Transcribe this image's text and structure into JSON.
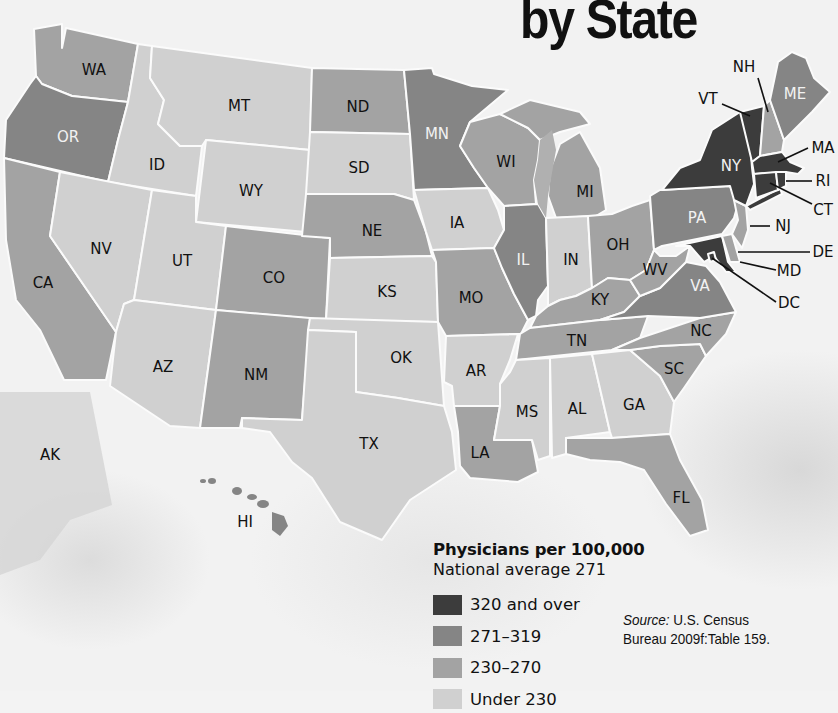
{
  "title": "by State",
  "legend": {
    "title": "Physicians per 100,000",
    "subtitle": "National average 271",
    "items": [
      {
        "label": "320 and over",
        "color": "#3c3c3c"
      },
      {
        "label": "271–319",
        "color": "#858585"
      },
      {
        "label": "230–270",
        "color": "#a3a3a3"
      },
      {
        "label": "Under 230",
        "color": "#d0d0d0"
      }
    ]
  },
  "source": {
    "prefix": "Source:",
    "line1": " U.S. Census",
    "line2": "Bureau 2009f:Table 159."
  },
  "map_data": {
    "metric": "Physicians per 100,000",
    "national_average": 271,
    "categories": [
      "320 and over",
      "271–319",
      "230–270",
      "Under 230"
    ],
    "states": {
      "NY": "320 and over",
      "VT": "320 and over",
      "MA": "320 and over",
      "CT": "320 and over",
      "RI": "320 and over",
      "MD": "320 and over",
      "DC": "320 and over",
      "OR": "271–319",
      "MN": "271–319",
      "IL": "271–319",
      "PA": "271–319",
      "VA": "271–319",
      "ME": "271–319",
      "WA": "230–270",
      "CA": "230–270",
      "CO": "230–270",
      "NM": "230–270",
      "ND": "230–270",
      "NE": "230–270",
      "MO": "230–270",
      "WI": "230–270",
      "MI": "230–270",
      "OH": "230–270",
      "KY": "230–270",
      "TN": "230–270",
      "NC": "230–270",
      "SC": "230–270",
      "LA": "230–270",
      "FL": "230–270",
      "WV": "230–270",
      "NH": "230–270",
      "NJ": "230–270",
      "DE": "230–270",
      "HI": "230–270",
      "ID": "Under 230",
      "MT": "Under 230",
      "WY": "Under 230",
      "SD": "Under 230",
      "NV": "Under 230",
      "UT": "Under 230",
      "AZ": "Under 230",
      "KS": "Under 230",
      "OK": "Under 230",
      "TX": "Under 230",
      "IA": "Under 230",
      "AR": "Under 230",
      "MS": "Under 230",
      "AL": "Under 230",
      "GA": "Under 230",
      "IN": "Under 230",
      "AK": "Under 230"
    }
  },
  "labels": {
    "WA": "WA",
    "OR": "OR",
    "CA": "CA",
    "ID": "ID",
    "NV": "NV",
    "MT": "MT",
    "WY": "WY",
    "UT": "UT",
    "AZ": "AZ",
    "CO": "CO",
    "NM": "NM",
    "ND": "ND",
    "SD": "SD",
    "NE": "NE",
    "KS": "KS",
    "OK": "OK",
    "TX": "TX",
    "MN": "MN",
    "IA": "IA",
    "MO": "MO",
    "AR": "AR",
    "LA": "LA",
    "WI": "WI",
    "IL": "IL",
    "MI": "MI",
    "IN": "IN",
    "OH": "OH",
    "KY": "KY",
    "TN": "TN",
    "MS": "MS",
    "AL": "AL",
    "GA": "GA",
    "FL": "FL",
    "SC": "SC",
    "NC": "NC",
    "VA": "VA",
    "WV": "WV",
    "PA": "PA",
    "NY": "NY",
    "ME": "ME",
    "NH": "NH",
    "VT": "VT",
    "MA": "MA",
    "RI": "RI",
    "CT": "CT",
    "NJ": "NJ",
    "DE": "DE",
    "MD": "MD",
    "DC": "DC",
    "AK": "AK",
    "HI": "HI"
  }
}
